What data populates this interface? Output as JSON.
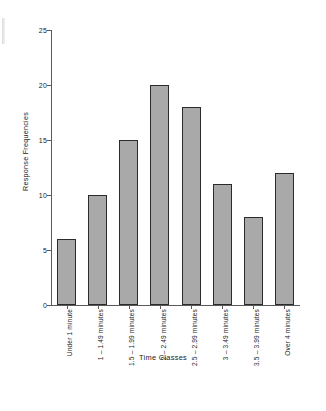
{
  "chart_data": {
    "type": "bar",
    "title": "",
    "subtitle": "",
    "xlabel": "Time Classes",
    "ylabel": "Response Frequencies",
    "categories": [
      "Under 1 minute",
      "1 – 1.49 minutes",
      "1.5 – 1.99 minutes",
      "2 – 2.49 minutes",
      "2.5 – 2.99 minutes",
      "3 – 3.49 minutes",
      "3.5 – 3.99 minutes",
      "Over 4 minutes"
    ],
    "values": [
      6,
      10,
      15,
      20,
      18,
      11,
      8,
      12
    ],
    "ylim": [
      0,
      25
    ],
    "ytick_labels": [
      "0",
      "5",
      "10",
      "15",
      "20",
      "25"
    ],
    "ytick_values": [
      0,
      5,
      10,
      15,
      20,
      25
    ],
    "grid": false,
    "legend": "none",
    "bar_fill_color": "#a9a9a9",
    "bar_edge_color": "#2b2b2b",
    "axis_color": "#5a5a5a"
  }
}
